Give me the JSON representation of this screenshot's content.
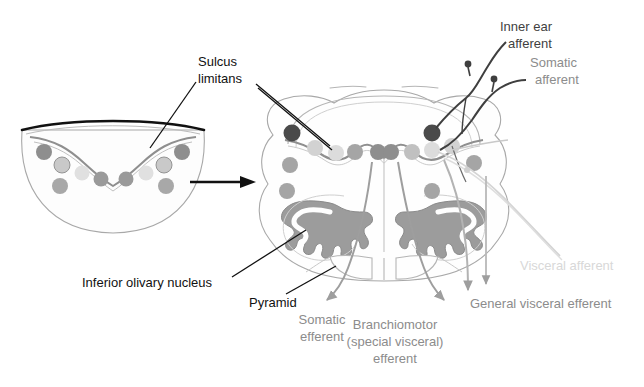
{
  "figure": {
    "background_color": "#ffffff"
  },
  "palette": {
    "outline": "#9a9a9a",
    "outline_dark": "#111111",
    "sulcus_line": "#8f8f8f",
    "olive_fill": "#9c9c9c",
    "dot_dark": "#4a4a4a",
    "dot_medium": "#9a9a9a",
    "dot_light": "#c9c9c9",
    "dot_vlight": "#dcdcdc",
    "dot_outline_light": "#bdbdbd",
    "afferent_fiber": "#3f3f3f",
    "efferent_fiber": "#9e9e9e",
    "visceral_fiber": "#cfcfcf",
    "leader_black": "#111111"
  },
  "panels": {
    "left": {
      "name": "embryonic-neural-tube",
      "description": "Embryonic hindbrain open neural tube, cut surface"
    },
    "right": {
      "name": "adult-medulla",
      "description": "Adult medulla oblongata cross section"
    },
    "transition_arrow": {
      "name": "development-arrow",
      "direction": "right",
      "color": "#111111"
    }
  },
  "labels": {
    "sulcus_limitans": {
      "line1": "Sulcus",
      "line2": "limitans",
      "color": "black",
      "x": 186,
      "y": 63
    },
    "inner_ear_afferent": {
      "line1": "Inner ear",
      "line2": "afferent",
      "color": "dark",
      "x": 496,
      "y": 25
    },
    "somatic_afferent": {
      "line1": "Somatic",
      "line2": "afferent",
      "color": "mid",
      "x": 530,
      "y": 63
    },
    "visceral_afferent": {
      "line1": "Visceral afferent",
      "color": "light",
      "x": 527,
      "y": 265
    },
    "general_visceral_efferent": {
      "line1": "General visceral efferent",
      "color": "mid",
      "x": 470,
      "y": 303
    },
    "branchiomotor_efferent": {
      "line1": "Branchiomotor",
      "line2": "(special visceral)",
      "line3": "efferent",
      "color": "mid",
      "x": 395,
      "y": 325
    },
    "somatic_efferent": {
      "line1": "Somatic",
      "line2": "efferent",
      "color": "mid",
      "x": 322,
      "y": 320
    },
    "inferior_olivary_nucleus": {
      "line1": "Inferior olivary nucleus",
      "color": "black",
      "x": 80,
      "y": 283
    },
    "pyramid": {
      "line1": "Pyramid",
      "color": "black",
      "x": 249,
      "y": 302
    }
  },
  "left_panel_dots": [
    {
      "name": "dot-dark-outer-left",
      "cx": 44,
      "cy": 152,
      "r": 8,
      "fill": "#8e8e8e",
      "stroke": "none"
    },
    {
      "name": "dot-ring-left",
      "cx": 62,
      "cy": 165,
      "r": 8,
      "fill": "#c9c9c9",
      "stroke": "#949494"
    },
    {
      "name": "dot-vlight-left",
      "cx": 82,
      "cy": 173,
      "r": 7.5,
      "fill": "#e0e0e0",
      "stroke": "none"
    },
    {
      "name": "dot-mid-left-inner",
      "cx": 101,
      "cy": 179,
      "r": 7.5,
      "fill": "#9a9a9a",
      "stroke": "none"
    },
    {
      "name": "dot-mid-left-low",
      "cx": 60,
      "cy": 186,
      "r": 8,
      "fill": "#a8a8a8",
      "stroke": "none"
    },
    {
      "name": "dot-mid-right-inner",
      "cx": 126,
      "cy": 179,
      "r": 7.5,
      "fill": "#9a9a9a",
      "stroke": "none"
    },
    {
      "name": "dot-vlight-right",
      "cx": 146,
      "cy": 173,
      "r": 7.5,
      "fill": "#e0e0e0",
      "stroke": "none"
    },
    {
      "name": "dot-ring-right",
      "cx": 164,
      "cy": 165,
      "r": 8,
      "fill": "#c9c9c9",
      "stroke": "#949494"
    },
    {
      "name": "dot-dark-outer-right",
      "cx": 182,
      "cy": 152,
      "r": 8,
      "fill": "#8e8e8e",
      "stroke": "none"
    },
    {
      "name": "dot-mid-right-low",
      "cx": 166,
      "cy": 186,
      "r": 8,
      "fill": "#a8a8a8",
      "stroke": "none"
    }
  ],
  "right_panel_dots": [
    {
      "name": "dot-inner-ear-left",
      "cx": 292,
      "cy": 133,
      "r": 8.5,
      "fill": "#4a4a4a",
      "stroke": "none"
    },
    {
      "name": "dot-somatic-aff-left",
      "cx": 315,
      "cy": 148,
      "r": 8,
      "fill": "#d2d2d2",
      "stroke": "none"
    },
    {
      "name": "dot-visceral-aff-left",
      "cx": 336,
      "cy": 153,
      "r": 8,
      "fill": "#dcdcdc",
      "stroke": "none"
    },
    {
      "name": "dot-gve-left",
      "cx": 355,
      "cy": 152,
      "r": 8,
      "fill": "#a5a5a5",
      "stroke": "none"
    },
    {
      "name": "dot-branchio-left",
      "cx": 378,
      "cy": 152,
      "r": 8,
      "fill": "#8e8e8e",
      "stroke": "none"
    },
    {
      "name": "dot-lateral-left",
      "cx": 290,
      "cy": 165,
      "r": 8,
      "fill": "#a5a5a5",
      "stroke": "none"
    },
    {
      "name": "dot-somatic-eff-left",
      "cx": 287,
      "cy": 191,
      "r": 8,
      "fill": "#a5a5a5",
      "stroke": "none"
    },
    {
      "name": "dot-inner-ear-right",
      "cx": 432,
      "cy": 133,
      "r": 8.5,
      "fill": "#4a4a4a",
      "stroke": "none"
    },
    {
      "name": "dot-somatic-aff-right",
      "cx": 409,
      "cy": 148,
      "r": 8,
      "fill": "#d2d2d2",
      "stroke": "none"
    },
    {
      "name": "dot-visceral-aff-right",
      "cx": 389,
      "cy": 153,
      "r": 8,
      "fill": "#dcdcdc",
      "stroke": "none"
    },
    {
      "name": "dot-gve-right",
      "cx": 400,
      "cy": 152,
      "r": 8,
      "fill": "#c0c0c0",
      "stroke": "none"
    },
    {
      "name": "dot-lateral-right",
      "cx": 437,
      "cy": 166,
      "r": 8,
      "fill": "#a5a5a5",
      "stroke": "none"
    },
    {
      "name": "dot-somatic-eff-right",
      "cx": 432,
      "cy": 191,
      "r": 8,
      "fill": "#a5a5a5",
      "stroke": "none"
    }
  ]
}
